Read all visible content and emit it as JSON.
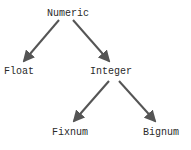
{
  "diagram": {
    "nodes": [
      {
        "id": "numeric",
        "label": "Numeric"
      },
      {
        "id": "float",
        "label": "Float"
      },
      {
        "id": "integer",
        "label": "Integer"
      },
      {
        "id": "fixnum",
        "label": "Fixnum"
      },
      {
        "id": "bignum",
        "label": "Bignum"
      }
    ],
    "edges": [
      {
        "from": "numeric",
        "to": "float"
      },
      {
        "from": "numeric",
        "to": "integer"
      },
      {
        "from": "integer",
        "to": "fixnum"
      },
      {
        "from": "integer",
        "to": "bignum"
      }
    ],
    "edge_color": "#555555"
  }
}
